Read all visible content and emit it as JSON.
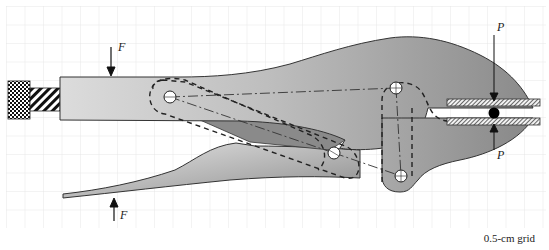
{
  "diagram": {
    "grid_label": "0.5-cm grid",
    "force_labels": {
      "handle_top": "F",
      "handle_bottom": "F",
      "jaw_top": "P",
      "jaw_bottom": "P"
    },
    "colors": {
      "body_fill_light": "#d9d9d9",
      "body_fill_dark": "#8c8c8c",
      "outline": "#333333",
      "grid": "#e4e4e4",
      "pin": "#ffffff",
      "workpiece": "#000000"
    },
    "components": [
      "adjusting-screw",
      "upper-handle",
      "upper-jaw",
      "lower-handle",
      "lower-jaw",
      "toggle-link",
      "pivot-pins",
      "workpiece-plates",
      "workpiece-ball"
    ]
  }
}
